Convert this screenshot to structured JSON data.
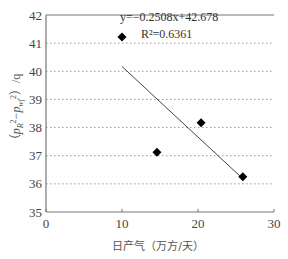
{
  "chart_data": {
    "type": "scatter",
    "title": "",
    "xlabel": "日产气（万方/天）",
    "ylabel": "（p_R² − p_wf²）/q",
    "xlim": [
      0,
      30
    ],
    "ylim": [
      35,
      42
    ],
    "x_ticks": [
      "0",
      "10",
      "20",
      "30"
    ],
    "y_ticks": [
      "35",
      "36",
      "37",
      "38",
      "39",
      "40",
      "41",
      "42"
    ],
    "grid": "horizontal dotted",
    "series": [
      {
        "name": "data",
        "marker": "diamond",
        "color": "#000000",
        "x": [
          14.6,
          20.4,
          25.9
        ],
        "y": [
          37.12,
          38.17,
          36.25
        ]
      }
    ],
    "trendline": {
      "type": "linear",
      "equation": "y=−0.2508x+42.678",
      "r_squared": "R²=0.6361",
      "slope": -0.2508,
      "intercept": 42.678,
      "x_range": [
        10,
        25.9
      ],
      "color": "#444444"
    },
    "legend": {
      "marker": "diamond",
      "position": "top-left inside plot"
    }
  }
}
